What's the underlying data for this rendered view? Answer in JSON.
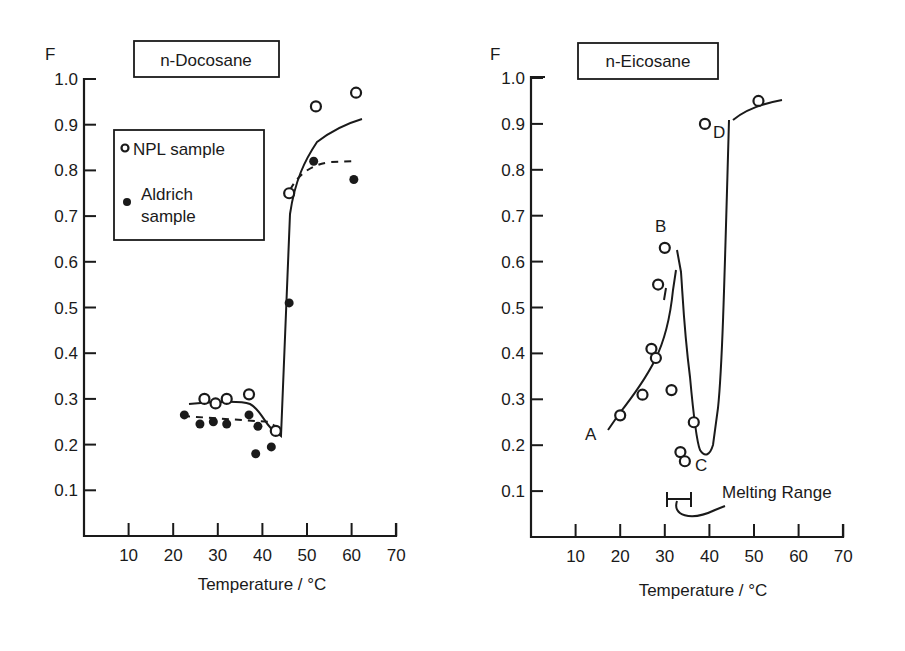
{
  "chart_data": [
    {
      "type": "scatter",
      "title": "n-Docosane",
      "xlabel": "Temperature / °C",
      "ylabel": "F",
      "xlim": [
        0,
        70
      ],
      "ylim": [
        0,
        1.0
      ],
      "xticks": [
        "10",
        "20",
        "30",
        "40",
        "50",
        "60",
        "70"
      ],
      "yticks": [
        "0.1",
        "0.2",
        "0.3",
        "0.4",
        "0.5",
        "0.6",
        "0.7",
        "0.8",
        "0.9",
        "1.0"
      ],
      "grid": false,
      "legend": {
        "position": "upper-left",
        "entries": [
          "NPL sample",
          "Aldrich sample"
        ]
      },
      "series": [
        {
          "name": "NPL sample",
          "marker": "open-circle",
          "line": "solid",
          "x": [
            27,
            29.5,
            32,
            37,
            43,
            46,
            52,
            61
          ],
          "y": [
            0.3,
            0.29,
            0.3,
            0.31,
            0.23,
            0.75,
            0.94,
            0.97
          ]
        },
        {
          "name": "Aldrich sample",
          "marker": "filled-circle",
          "line": "dashed",
          "x": [
            22.5,
            26,
            29,
            32,
            37,
            39,
            38.5,
            42,
            46,
            51.5,
            60.5
          ],
          "y": [
            0.265,
            0.245,
            0.25,
            0.245,
            0.265,
            0.24,
            0.18,
            0.195,
            0.51,
            0.82,
            0.78
          ]
        }
      ]
    },
    {
      "type": "line",
      "title": "n-Eicosane",
      "xlabel": "Temperature / °C",
      "ylabel": "F",
      "xlim": [
        0,
        70
      ],
      "ylim": [
        0,
        1.0
      ],
      "xticks": [
        "10",
        "20",
        "30",
        "40",
        "50",
        "60",
        "70"
      ],
      "yticks": [
        "0.1",
        "0.2",
        "0.3",
        "0.4",
        "0.5",
        "0.6",
        "0.7",
        "0.8",
        "0.9",
        "1.0"
      ],
      "grid": false,
      "series": [
        {
          "name": "n-Eicosane",
          "marker": "open-circle",
          "line": "solid",
          "x": [
            20,
            25,
            27,
            28,
            28.5,
            30,
            31.5,
            33.5,
            34.5,
            36.5,
            39,
            51
          ],
          "y": [
            0.265,
            0.31,
            0.41,
            0.39,
            0.55,
            0.63,
            0.32,
            0.185,
            0.165,
            0.25,
            0.9,
            0.95
          ]
        }
      ],
      "annotations": [
        {
          "text": "A",
          "x": 16,
          "y": 0.19
        },
        {
          "text": "B",
          "x": 30,
          "y": 0.69
        },
        {
          "text": "C",
          "x": 37.5,
          "y": 0.15
        },
        {
          "text": "D",
          "x": 42,
          "y": 0.88
        },
        {
          "text": "Melting Range",
          "x_range": [
            31,
            36
          ],
          "y": 0.08
        }
      ]
    }
  ],
  "left": {
    "title": "n-Docosane",
    "y_axis_label": "F",
    "x_axis_label": "Temperature / °C",
    "legend_npl": "NPL sample",
    "legend_aldrich_1": "Aldrich",
    "legend_aldrich_2": "sample"
  },
  "right": {
    "title": "n-Eicosane",
    "y_axis_label": "F",
    "x_axis_label": "Temperature / °C",
    "label_a": "A",
    "label_b": "B",
    "label_c": "C",
    "label_d": "D",
    "melting_range": "Melting Range"
  }
}
